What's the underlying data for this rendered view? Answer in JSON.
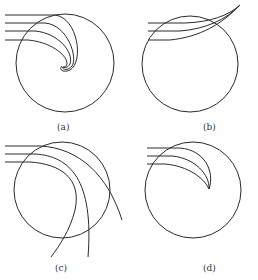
{
  "figure": {
    "stroke_color": "#2a2a2a",
    "background": "#ffffff",
    "panels": [
      {
        "id": "a",
        "label": "(a)",
        "description": "rays spiral into circle and curl to a point"
      },
      {
        "id": "b",
        "label": "(b)",
        "description": "rays bend upward and converge outside circle top-right"
      },
      {
        "id": "c",
        "label": "(c)",
        "description": "rays pass through circle and exit downward"
      },
      {
        "id": "d",
        "label": "(d)",
        "description": "rays converge to a cusp inside circle"
      }
    ]
  }
}
